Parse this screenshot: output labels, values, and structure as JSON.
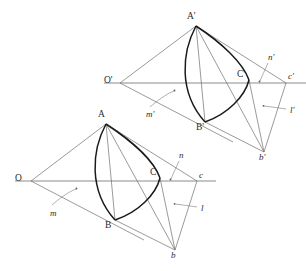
{
  "figure": {
    "background_color": "#ffffff",
    "stroke_color_thin": "#595959",
    "stroke_color_axis": "#8c8c8c",
    "stroke_color_curve": "#1a1a1a",
    "label_color": "#2b2b2b"
  },
  "upper_figure": {
    "name": "primed-figure",
    "points": {
      "O": {
        "label": "O'",
        "x": 120,
        "y": 83,
        "label_x": 104,
        "label_y": 76
      },
      "A": {
        "label": "A'",
        "x": 196,
        "y": 26,
        "label_x": 187,
        "label_y": 12
      },
      "B": {
        "label": "B'",
        "x": 205,
        "y": 122,
        "label_x": 196,
        "label_y": 123
      },
      "C": {
        "label": "C'",
        "x": 249,
        "y": 80,
        "label_x": 241,
        "label_y": 70
      },
      "c": {
        "label": "c'",
        "x": 286,
        "y": 83,
        "label_x": 288,
        "label_y": 72
      },
      "b": {
        "label": "b'",
        "x": 264,
        "y": 152,
        "label_x": 259,
        "label_y": 153
      }
    },
    "annotations": {
      "m": {
        "label": "m'",
        "x": 155,
        "y": 111
      },
      "n": {
        "label": "n'",
        "x": 270,
        "y": 57
      },
      "l": {
        "label": "l'",
        "x": 290,
        "y": 110
      }
    }
  },
  "lower_figure": {
    "name": "unprimed-figure",
    "points": {
      "O": {
        "label": "O",
        "x": 31,
        "y": 181,
        "label_x": 15,
        "label_y": 174
      },
      "A": {
        "label": "A",
        "x": 106,
        "y": 124,
        "label_x": 98,
        "label_y": 110
      },
      "B": {
        "label": "B",
        "x": 115,
        "y": 220,
        "label_x": 107,
        "label_y": 221
      },
      "C": {
        "label": "C",
        "x": 160,
        "y": 178,
        "label_x": 152,
        "label_y": 168
      },
      "c": {
        "label": "c",
        "x": 197,
        "y": 181,
        "label_x": 199,
        "label_y": 171
      },
      "b": {
        "label": "b",
        "x": 175,
        "y": 250,
        "label_x": 171,
        "label_y": 251
      }
    },
    "annotations": {
      "m": {
        "label": "m",
        "x": 57,
        "y": 209
      },
      "n": {
        "label": "n",
        "x": 181,
        "y": 155
      },
      "l": {
        "label": "l",
        "x": 201,
        "y": 208
      }
    }
  }
}
